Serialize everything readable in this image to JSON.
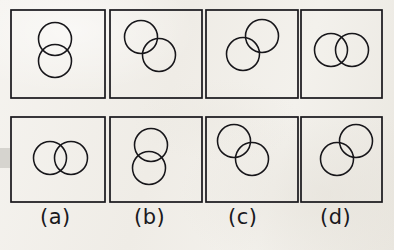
{
  "figure": {
    "background_color": "#f2f0ec",
    "ink_color": "#17161a",
    "rows": 2,
    "columns": 4,
    "box_size": 94,
    "circle_radius": 16.5
  },
  "labels": [
    {
      "id": "a",
      "text": "(a)",
      "x": 40,
      "y": 207
    },
    {
      "id": "b",
      "text": "(b)",
      "x": 134,
      "y": 207
    },
    {
      "id": "c",
      "text": "(c)",
      "x": 228,
      "y": 207
    },
    {
      "id": "d",
      "text": "(d)",
      "x": 320,
      "y": 207
    }
  ],
  "cells": [
    {
      "id": "top-a",
      "row": "top",
      "column": "a",
      "box": {
        "x": 11,
        "y": 10,
        "w": 94,
        "h": 88
      },
      "arrangement": "vertical-stack",
      "description": "two circles stacked vertically with overlap",
      "circles": [
        {
          "cx": 55,
          "cy": 39,
          "r": 16.5
        },
        {
          "cx": 55,
          "cy": 61,
          "r": 16.5
        }
      ]
    },
    {
      "id": "top-b",
      "row": "top",
      "column": "b",
      "box": {
        "x": 110,
        "y": 10,
        "w": 92,
        "h": 88
      },
      "arrangement": "diagonal-upper-left-to-lower-right",
      "description": "upper-left circle overlapping lower-right circle",
      "circles": [
        {
          "cx": 141,
          "cy": 37,
          "r": 16.5
        },
        {
          "cx": 159,
          "cy": 55,
          "r": 16.5
        }
      ]
    },
    {
      "id": "top-c",
      "row": "top",
      "column": "c",
      "box": {
        "x": 206,
        "y": 10,
        "w": 92,
        "h": 88
      },
      "arrangement": "diagonal-upper-right-to-lower-left",
      "description": "upper-right circle overlapping lower-left circle",
      "circles": [
        {
          "cx": 262,
          "cy": 36,
          "r": 16.5
        },
        {
          "cx": 243,
          "cy": 54,
          "r": 16.5
        }
      ]
    },
    {
      "id": "top-d",
      "row": "top",
      "column": "d",
      "box": {
        "x": 301,
        "y": 10,
        "w": 81,
        "h": 88
      },
      "arrangement": "horizontal-pair",
      "description": "two circles side by side horizontally",
      "circles": [
        {
          "cx": 331,
          "cy": 50,
          "r": 16.5
        },
        {
          "cx": 352,
          "cy": 50,
          "r": 16.5
        }
      ]
    },
    {
      "id": "bottom-a",
      "row": "bottom",
      "column": "a",
      "box": {
        "x": 11,
        "y": 117,
        "w": 94,
        "h": 85
      },
      "arrangement": "horizontal-pair",
      "description": "two circles side by side horizontally",
      "circles": [
        {
          "cx": 50,
          "cy": 158,
          "r": 16.5
        },
        {
          "cx": 71,
          "cy": 158,
          "r": 16.5
        }
      ]
    },
    {
      "id": "bottom-b",
      "row": "bottom",
      "column": "b",
      "box": {
        "x": 110,
        "y": 117,
        "w": 92,
        "h": 85
      },
      "arrangement": "vertical-stack",
      "description": "two circles stacked vertically with overlap",
      "circles": [
        {
          "cx": 151,
          "cy": 145,
          "r": 16.5
        },
        {
          "cx": 149,
          "cy": 168,
          "r": 16.5
        }
      ]
    },
    {
      "id": "bottom-c",
      "row": "bottom",
      "column": "c",
      "box": {
        "x": 206,
        "y": 117,
        "w": 92,
        "h": 85
      },
      "arrangement": "diagonal-upper-left-to-lower-right",
      "description": "upper-left circle overlapping lower-right circle",
      "circles": [
        {
          "cx": 234,
          "cy": 141,
          "r": 16.5
        },
        {
          "cx": 252,
          "cy": 159,
          "r": 16.5
        }
      ]
    },
    {
      "id": "bottom-d",
      "row": "bottom",
      "column": "d",
      "box": {
        "x": 301,
        "y": 117,
        "w": 81,
        "h": 85
      },
      "arrangement": "diagonal-upper-right-to-lower-left",
      "description": "upper-right circle overlapping lower-left circle",
      "circles": [
        {
          "cx": 356,
          "cy": 141,
          "r": 16.5
        },
        {
          "cx": 337,
          "cy": 159,
          "r": 16.5
        }
      ]
    }
  ]
}
